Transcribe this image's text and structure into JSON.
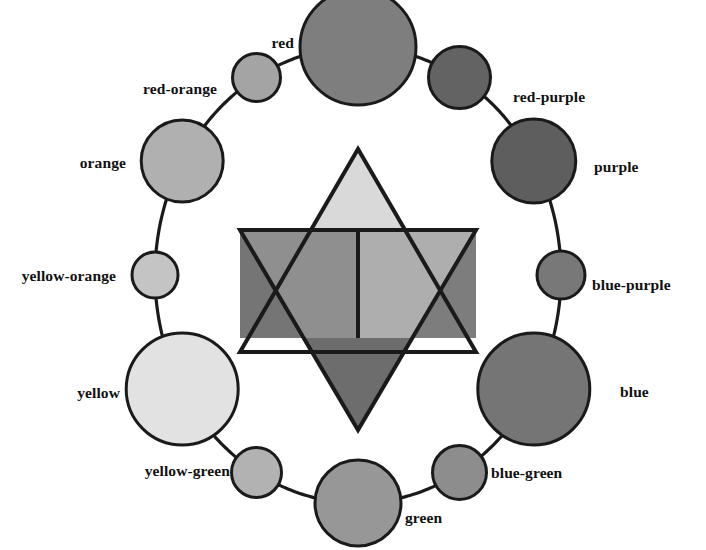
{
  "diagram": {
    "background": "#ffffff",
    "stroke": "#1a1a1a"
  },
  "wheel": {
    "center": {
      "x": 358,
      "y": 275
    },
    "radius_x": 203,
    "radius_y": 228,
    "ring_line_color": "#1a1a1a",
    "ring_line_width": 3.2,
    "nodes": [
      {
        "id": "red",
        "label": "red",
        "angle": -90,
        "r": 58,
        "fill": "#7e7e7e",
        "label_side": "left",
        "label_x": 294,
        "label_y": 43
      },
      {
        "id": "red-purple",
        "label": "red-purple",
        "angle": -60,
        "r": 31,
        "fill": "#636363",
        "label_side": "right",
        "label_x": 513,
        "label_y": 97
      },
      {
        "id": "purple",
        "label": "purple",
        "angle": -30,
        "r": 42,
        "fill": "#5e5e5e",
        "label_side": "right",
        "label_x": 594,
        "label_y": 167
      },
      {
        "id": "blue-purple",
        "label": "blue-purple",
        "angle": 0,
        "r": 24,
        "fill": "#787878",
        "label_side": "right",
        "label_x": 592,
        "label_y": 285
      },
      {
        "id": "blue",
        "label": "blue",
        "angle": 30,
        "r": 56,
        "fill": "#757575",
        "label_side": "right",
        "label_x": 620,
        "label_y": 392
      },
      {
        "id": "blue-green",
        "label": "blue-green",
        "angle": 60,
        "r": 27,
        "fill": "#8d8d8d",
        "label_side": "right",
        "label_x": 491,
        "label_y": 473
      },
      {
        "id": "green",
        "label": "green",
        "angle": 90,
        "r": 43,
        "fill": "#979797",
        "label_side": "right",
        "label_x": 405,
        "label_y": 518
      },
      {
        "id": "yellow-green",
        "label": "yellow-green",
        "angle": 120,
        "r": 25,
        "fill": "#b2b2b2",
        "label_side": "left",
        "label_x": 230,
        "label_y": 471
      },
      {
        "id": "yellow",
        "label": "yellow",
        "angle": 150,
        "r": 56,
        "fill": "#e2e2e2",
        "label_side": "left",
        "label_x": 120,
        "label_y": 393
      },
      {
        "id": "yellow-orange",
        "label": "yellow-orange",
        "angle": 180,
        "r": 23,
        "fill": "#c4c4c4",
        "label_side": "left",
        "label_x": 116,
        "label_y": 276
      },
      {
        "id": "orange",
        "label": "orange",
        "angle": -150,
        "r": 41,
        "fill": "#b0b0b0",
        "label_side": "left",
        "label_x": 126,
        "label_y": 163
      },
      {
        "id": "red-orange",
        "label": "red-orange",
        "angle": -120,
        "r": 24,
        "fill": "#a4a4a4",
        "label_side": "left",
        "label_x": 217,
        "label_y": 89
      }
    ]
  },
  "star": {
    "name": "value-star",
    "center": {
      "x": 358,
      "y": 282
    },
    "half_width": 118,
    "up_triangle": {
      "name": "upward-triangle",
      "points": "358,149 476,352 240,352",
      "tip_fill": "#d9d9d9",
      "tip_points": "358,149 414,245 302,245"
    },
    "down_triangle": {
      "name": "downward-triangle",
      "points": "240,230 476,230 358,430",
      "tip_fill": "#6d6d6d",
      "tip_points": "302,338 414,338 358,430"
    },
    "hexagon_left_fill": "#8f8f8f",
    "hexagon_right_fill": "#aeaeae",
    "left_point_fill": "#757575",
    "right_point_fill": "#7d7d7d",
    "divider_line": {
      "x": 358,
      "y1": 230,
      "y2": 338
    }
  }
}
